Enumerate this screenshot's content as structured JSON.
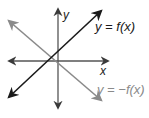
{
  "diagram": {
    "title": "",
    "axes": {
      "x_label": "x",
      "y_label": "y"
    },
    "curves": [
      {
        "label": "y = f(x)",
        "color": "#1a1a1a",
        "from": [
          8,
          98
        ],
        "to": [
          102,
          10
        ]
      },
      {
        "label": "y = −f(x)",
        "color": "#8a8a8a",
        "from": [
          8,
          20
        ],
        "to": [
          102,
          100
        ]
      }
    ],
    "colors": {
      "axis": "#555555",
      "f_line": "#1a1a1a",
      "neg_f_line": "#8a8a8a",
      "background": "#ffffff"
    }
  }
}
